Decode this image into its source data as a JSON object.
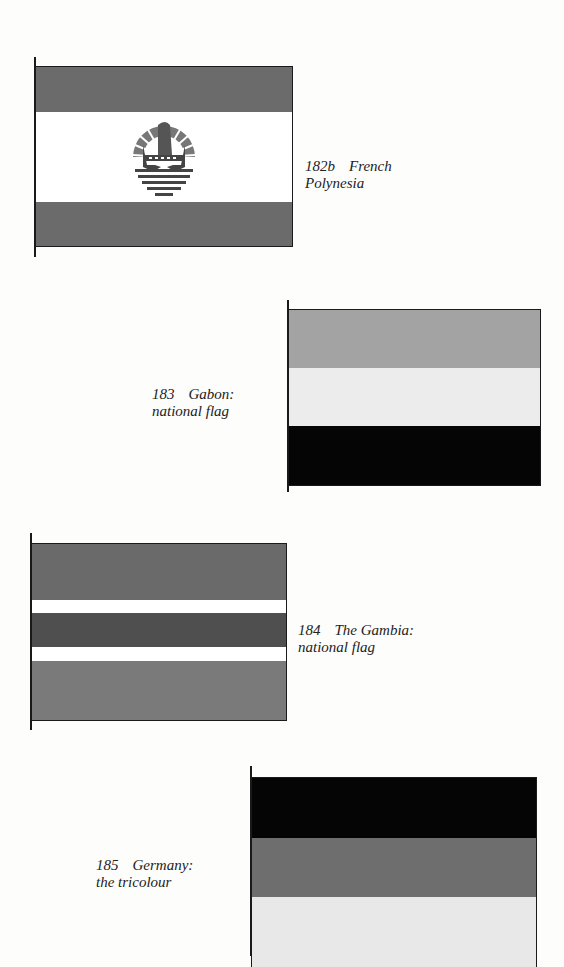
{
  "flags": [
    {
      "id": "182b",
      "number": "182b",
      "name": "French",
      "caption_line2": "Polynesia",
      "stripes": [
        {
          "color": "#6b6b6b",
          "label": "red"
        },
        {
          "color": "#ffffff",
          "label": "white"
        },
        {
          "color": "#6b6b6b",
          "label": "red"
        }
      ],
      "emblem": "coat-of-arms"
    },
    {
      "id": "183",
      "number": "183",
      "name": "Gabon:",
      "caption_line2": "national flag",
      "stripes": [
        {
          "color": "#a3a3a3",
          "label": "green"
        },
        {
          "color": "#ececec",
          "label": "yellow"
        },
        {
          "color": "#050505",
          "label": "blue"
        }
      ]
    },
    {
      "id": "184",
      "number": "184",
      "name": "The Gambia:",
      "caption_line2": "national flag",
      "stripes": [
        {
          "color": "#6a6a6a",
          "label": "red"
        },
        {
          "color": "#ffffff",
          "label": "white"
        },
        {
          "color": "#4f4f4f",
          "label": "blue"
        },
        {
          "color": "#ffffff",
          "label": "white"
        },
        {
          "color": "#7a7a7a",
          "label": "green"
        }
      ]
    },
    {
      "id": "185",
      "number": "185",
      "name": "Germany:",
      "caption_line2": "the tricolour",
      "stripes": [
        {
          "color": "#050505",
          "label": "black"
        },
        {
          "color": "#6e6e6e",
          "label": "red"
        },
        {
          "color": "#e8e8e8",
          "label": "gold"
        }
      ]
    }
  ]
}
